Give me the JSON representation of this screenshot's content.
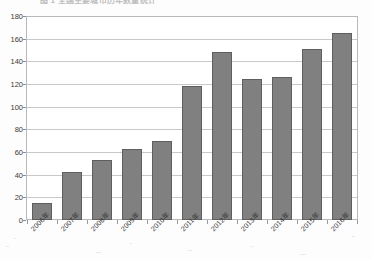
{
  "document": {
    "title_partial": "图 1  全国主要城市历年数量统计"
  },
  "chart_data": {
    "type": "bar",
    "title": "",
    "xlabel": "",
    "ylabel": "",
    "categories": [
      "2006年",
      "2007年",
      "2008年",
      "2009年",
      "2010年",
      "2011年",
      "2012年",
      "2013年",
      "2014年",
      "2015年",
      "2016年"
    ],
    "values": [
      15,
      43,
      53,
      63,
      70,
      119,
      149,
      125,
      127,
      152,
      166
    ],
    "series": [
      {
        "name": "数量",
        "values": [
          15,
          43,
          53,
          63,
          70,
          119,
          149,
          125,
          127,
          152,
          166
        ]
      }
    ],
    "ylim": [
      0,
      180
    ],
    "yticks": [
      0,
      20,
      40,
      60,
      80,
      100,
      120,
      140,
      160,
      180
    ],
    "ytick_labels": [
      "0",
      "20",
      "40",
      "60",
      "80",
      "100",
      "120",
      "140",
      "160",
      "180"
    ],
    "grid": true,
    "legend": "none",
    "bar_color": "#808080",
    "bar_border_color": "#5e5e5e",
    "gridline_color": "#c9c9c9",
    "axis_color": "#b9b9b9"
  }
}
